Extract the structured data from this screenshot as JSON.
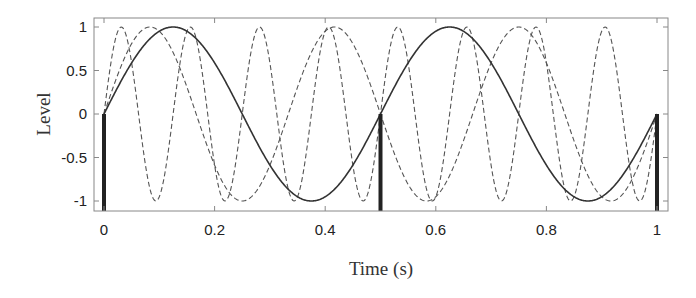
{
  "chart_data": {
    "type": "line",
    "title": "",
    "xlabel": "Time (s)",
    "ylabel": "Level",
    "xlim": [
      0,
      1
    ],
    "ylim": [
      -1.1,
      1.1
    ],
    "grid": false,
    "legend": null,
    "x_ticks": [
      "0",
      "0.2",
      "0.4",
      "0.6",
      "0.8",
      "1"
    ],
    "x_tick_values": [
      0,
      0.2,
      0.4,
      0.6,
      0.8,
      1
    ],
    "y_ticks": [
      "1",
      "0.5",
      "0",
      "-0.5",
      "-1"
    ],
    "y_tick_values": [
      1,
      0.5,
      0,
      -0.5,
      -1
    ],
    "series": [
      {
        "name": "2 Hz sinusoid",
        "style": "solid",
        "color": "#333333",
        "frequency_hz": 2,
        "function": "sin(2*pi*2*t)"
      },
      {
        "name": "3 Hz sinusoid",
        "style": "dashed",
        "color": "#555555",
        "frequency_hz": 3,
        "function": "sin(2*pi*3*t)"
      },
      {
        "name": "8 Hz sinusoid",
        "style": "dashed",
        "color": "#555555",
        "frequency_hz": 8,
        "function": "sin(2*pi*8*t)"
      }
    ],
    "samples": {
      "style": "stem",
      "color": "#222222",
      "x": [
        0,
        0.5,
        1
      ],
      "y": [
        0,
        0,
        0
      ],
      "baseline": -1.1
    }
  },
  "axes": {
    "x_label": "Time (s)",
    "y_label": "Level"
  }
}
